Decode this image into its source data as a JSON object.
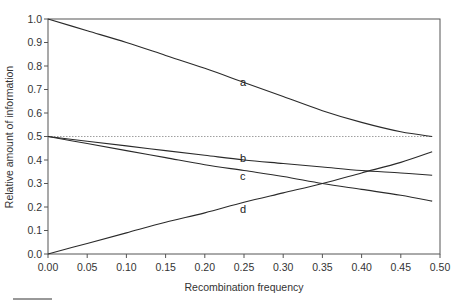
{
  "chart_data": {
    "type": "line",
    "title": "",
    "xlabel": "Recombination frequency",
    "ylabel": "Relative amount of information",
    "xlim": [
      0.0,
      0.5
    ],
    "ylim": [
      0.0,
      1.0
    ],
    "grid": false,
    "legend": "inline curve labels",
    "x_ticks": [
      "0.00",
      "0.05",
      "0.10",
      "0.15",
      "0.20",
      "0.25",
      "0.30",
      "0.35",
      "0.40",
      "0.45",
      "0.50"
    ],
    "y_ticks": [
      "0.0",
      "0.1",
      "0.2",
      "0.3",
      "0.4",
      "0.5",
      "0.6",
      "0.7",
      "0.8",
      "0.9",
      "1.0"
    ],
    "x": [
      0.0,
      0.05,
      0.1,
      0.15,
      0.2,
      0.25,
      0.3,
      0.35,
      0.4,
      0.45,
      0.49
    ],
    "series": [
      {
        "name": "a",
        "values": [
          1.0,
          0.95,
          0.9,
          0.845,
          0.79,
          0.73,
          0.67,
          0.61,
          0.56,
          0.52,
          0.5
        ],
        "label_at": [
          0.25,
          0.73
        ]
      },
      {
        "name": "b",
        "values": [
          0.5,
          0.48,
          0.46,
          0.44,
          0.42,
          0.4,
          0.385,
          0.37,
          0.355,
          0.345,
          0.335
        ],
        "label_at": [
          0.25,
          0.41
        ]
      },
      {
        "name": "c",
        "values": [
          0.5,
          0.47,
          0.44,
          0.41,
          0.38,
          0.355,
          0.33,
          0.3,
          0.275,
          0.25,
          0.225
        ],
        "label_at": [
          0.25,
          0.33
        ]
      },
      {
        "name": "d",
        "values": [
          0.0,
          0.045,
          0.09,
          0.135,
          0.175,
          0.22,
          0.26,
          0.3,
          0.345,
          0.39,
          0.435
        ],
        "label_at": [
          0.25,
          0.19
        ]
      }
    ],
    "reference_lines": [
      {
        "type": "horizontal",
        "y": 0.5,
        "style": "dotted"
      }
    ]
  },
  "colors": {
    "curve": "#2a2a2a",
    "axis": "#555555",
    "reference": "#888888"
  }
}
